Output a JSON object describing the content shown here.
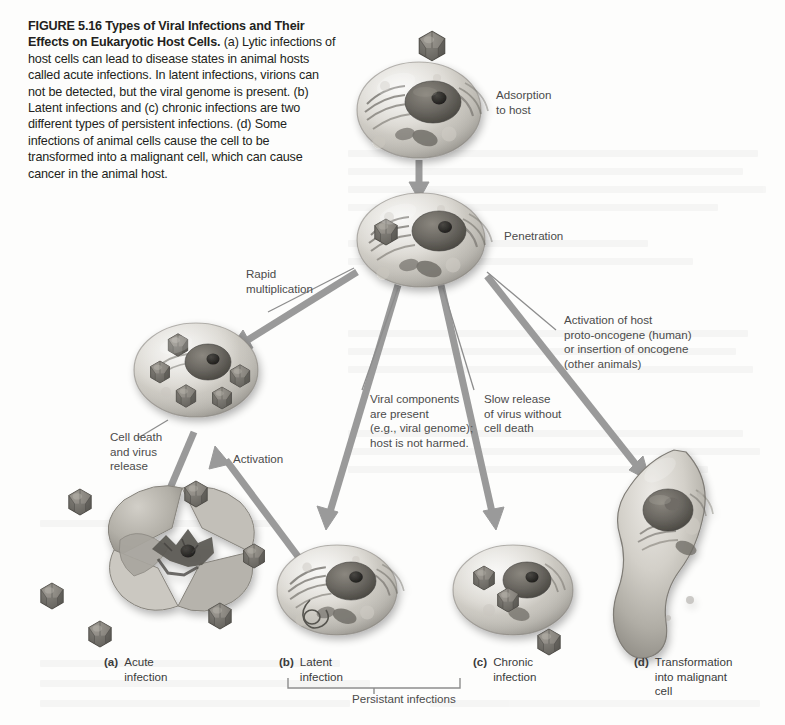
{
  "figure": {
    "number": "FIGURE 5.16",
    "title": "Types of Viral Infections and Their Effects on Eukaryotic Host Cells.",
    "caption_body": " (a) Lytic infections of host cells can lead to disease states in animal hosts called acute infections. In latent infections, virions can not be detected, but the viral genome is present. (b) Latent infections and (c) chronic infections are two different types of persistent infections. (d) Some infections of animal cells cause the cell to be transformed into a malignant cell, which can cause cancer in the animal host."
  },
  "process_labels": {
    "adsorption": "Adsorption\nto host",
    "penetration": "Penetration",
    "rapid_multiplication": "Rapid\nmultiplication",
    "cell_death": "Cell death\nand virus\nrelease",
    "activation": "Activation",
    "viral_components": "Viral components\nare present\n(e.g., viral genome);\nhost is not harmed.",
    "slow_release": "Slow release\nof virus without\ncell death",
    "oncogene": "Activation of host\nproto-oncogene (human)\nor insertion of oncogene\n(other animals)"
  },
  "panels": [
    {
      "letter": "(a)",
      "text": "Acute\ninfection"
    },
    {
      "letter": "(b)",
      "text": "Latent\ninfection"
    },
    {
      "letter": "(c)",
      "text": "Chronic\ninfection"
    },
    {
      "letter": "(d)",
      "text": "Transformation\ninto malignant\ncell"
    }
  ],
  "bracket": {
    "label": "Persistant infections"
  },
  "colors": {
    "page_background": "#fdfdfc",
    "arrow_gray": "#9a9a9a",
    "leader_line_gray": "#8d8d8d",
    "caption_text": "#231f20",
    "label_text": "#4b4b4b",
    "cell_body_light": "#e3e1dc",
    "cell_body_mid": "#b9b6ae",
    "cell_body_dark": "#8e8b84",
    "nucleus_dark": "#5d5a55",
    "nucleolus": "#2b2926",
    "virion_dark": "#6f6c66",
    "virion_light": "#a4a09a",
    "lysed_cell": "#b0ada6"
  }
}
